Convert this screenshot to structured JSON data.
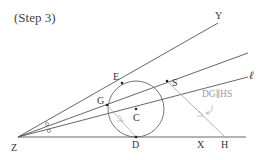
{
  "title": "(Step 3)",
  "colors": {
    "line": "#555555",
    "light_line": "#a8a8a8",
    "note": "#9a9a9a",
    "label": "#333333"
  },
  "points": {
    "Z": {
      "label": "Z",
      "x": 18,
      "y": 137
    },
    "Y": {
      "label": "Y",
      "x": 218,
      "y": 22
    },
    "E": {
      "label": "E",
      "x": 122,
      "y": 83
    },
    "G": {
      "label": "G",
      "x": 107,
      "y": 105
    },
    "C": {
      "label": "C",
      "x": 136,
      "y": 109
    },
    "D": {
      "label": "D",
      "x": 136,
      "y": 137
    },
    "S": {
      "label": "S",
      "x": 167,
      "y": 81
    },
    "X": {
      "label": "X",
      "x": 200,
      "y": 137
    },
    "H": {
      "label": "H",
      "x": 225,
      "y": 137
    }
  },
  "lines": {
    "ray_y": "ZY",
    "ray_s": "Z through S",
    "ray_l": "ℓ",
    "base": "ZX"
  },
  "line_label": "ℓ",
  "circle": {
    "center": "C",
    "radius": 28
  },
  "angle_marks": [
    "o",
    "o"
  ],
  "annotation": "DG∥HS"
}
